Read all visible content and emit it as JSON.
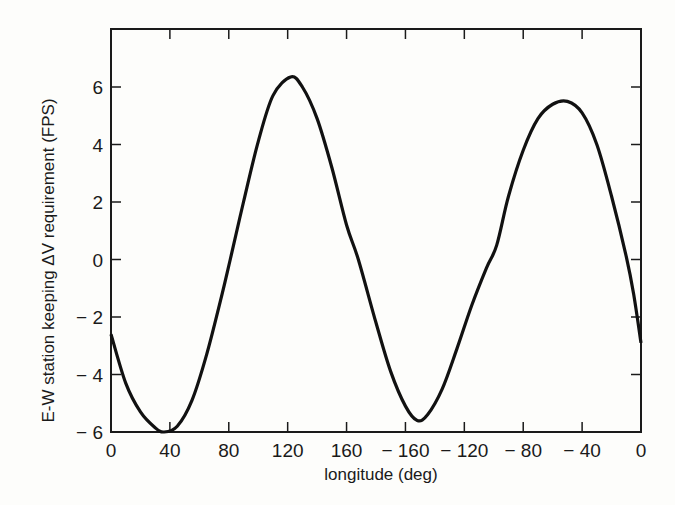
{
  "chart_data": {
    "type": "line",
    "title": "",
    "xlabel": "longitude (deg)",
    "ylabel": "E-W station keeping ΔV requirement (FPS)",
    "xlim": [
      0,
      360
    ],
    "ylim": [
      -6,
      8
    ],
    "grid": false,
    "legend": "none",
    "x_ticks": [
      {
        "value": 0,
        "label": "0"
      },
      {
        "value": 40,
        "label": "40"
      },
      {
        "value": 80,
        "label": "80"
      },
      {
        "value": 120,
        "label": "120"
      },
      {
        "value": 160,
        "label": "160"
      },
      {
        "value": 200,
        "label": "− 160"
      },
      {
        "value": 240,
        "label": "− 120"
      },
      {
        "value": 280,
        "label": "− 80"
      },
      {
        "value": 320,
        "label": "− 40"
      },
      {
        "value": 360,
        "label": "0"
      }
    ],
    "y_ticks": [
      {
        "value": 6,
        "label": "6"
      },
      {
        "value": 4,
        "label": "4"
      },
      {
        "value": 2,
        "label": "2"
      },
      {
        "value": 0,
        "label": "0"
      },
      {
        "value": -2,
        "label": "− 2"
      },
      {
        "value": -4,
        "label": "− 4"
      },
      {
        "value": -6,
        "label": "− 6"
      }
    ],
    "series": [
      {
        "name": "delta-v requirement",
        "color": "#111111",
        "x": [
          0,
          10,
          20,
          30,
          36,
          45,
          55,
          65,
          75,
          81,
          90,
          100,
          110,
          122,
          130,
          140,
          150,
          160,
          168,
          180,
          190,
          200,
          208,
          215,
          225,
          235,
          245,
          255,
          262,
          270,
          280,
          290,
          300,
          310,
          320,
          330,
          340,
          350,
          355,
          360
        ],
        "values": [
          -2.6,
          -4.3,
          -5.3,
          -5.85,
          -6.0,
          -5.8,
          -4.9,
          -3.3,
          -1.3,
          0.0,
          2.0,
          4.1,
          5.7,
          6.35,
          6.0,
          4.9,
          3.2,
          1.2,
          0.0,
          -2.2,
          -3.9,
          -5.1,
          -5.6,
          -5.4,
          -4.5,
          -3.1,
          -1.6,
          -0.3,
          0.5,
          2.2,
          3.8,
          4.9,
          5.4,
          5.5,
          5.1,
          4.0,
          2.2,
          0.1,
          -1.2,
          -2.9
        ]
      }
    ]
  }
}
